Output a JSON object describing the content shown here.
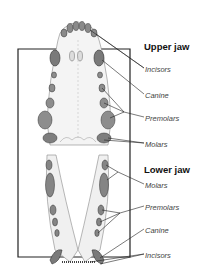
{
  "diagram": {
    "colors": {
      "line": "#222222",
      "bone": "#f2f2f2",
      "tooth": "#9a9a9a",
      "tooth_dark": "#555555",
      "text": "#444444",
      "heading": "#111111"
    }
  },
  "upper_jaw": {
    "heading": "Upper jaw",
    "labels": [
      {
        "text": "Incisors",
        "x": 145,
        "y": 65
      },
      {
        "text": "Canine",
        "x": 145,
        "y": 91
      },
      {
        "text": "Premolars",
        "x": 145,
        "y": 114
      },
      {
        "text": "Molars",
        "x": 145,
        "y": 140
      }
    ]
  },
  "lower_jaw": {
    "heading": "Lower jaw",
    "labels": [
      {
        "text": "Molars",
        "x": 145,
        "y": 181
      },
      {
        "text": "Premolars",
        "x": 145,
        "y": 203
      },
      {
        "text": "Canine",
        "x": 145,
        "y": 226
      },
      {
        "text": "Incisors",
        "x": 145,
        "y": 251
      }
    ]
  }
}
